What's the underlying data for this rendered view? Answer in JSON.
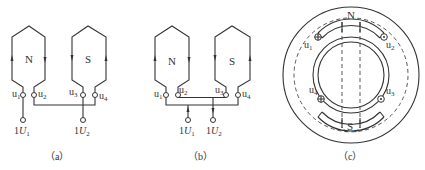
{
  "figure": {
    "panels": [
      {
        "caption": "(a)",
        "coils": [
          {
            "pole": "N",
            "terminals": [
              "u1",
              "u2"
            ]
          },
          {
            "pole": "S",
            "terminals": [
              "u3",
              "u4"
            ]
          }
        ],
        "supply": [
          "1U1",
          "1U2"
        ]
      },
      {
        "caption": "(b)",
        "coils": [
          {
            "pole": "N",
            "terminals": [
              "u1",
              "u2"
            ]
          },
          {
            "pole": "S",
            "terminals": [
              "u3",
              "u4"
            ]
          }
        ],
        "supply": [
          "1U1",
          "1U2"
        ]
      },
      {
        "caption": "(c)",
        "poles": [
          "N",
          "S"
        ],
        "terminals": [
          "u1",
          "u2",
          "u3",
          "u4"
        ]
      }
    ]
  },
  "labels": {
    "a": {
      "N": "N",
      "S": "S",
      "u1": "u",
      "u1s": "1",
      "u2": "u",
      "u2s": "2",
      "u3": "u",
      "u3s": "3",
      "u4": "u",
      "u4s": "4",
      "U1p": "1",
      "U1": "U",
      "U1s": "1",
      "U2p": "1",
      "U2": "U",
      "U2s": "2",
      "cap": "（a）"
    },
    "b": {
      "N": "N",
      "S": "S",
      "u1": "u",
      "u1s": "1",
      "u2": "u",
      "u2s": "2",
      "u3": "u",
      "u3s": "3",
      "u4": "u",
      "u4s": "4",
      "U1p": "1",
      "U1": "U",
      "U1s": "1",
      "U2p": "1",
      "U2": "U",
      "U2s": "2",
      "cap": "（b）"
    },
    "c": {
      "N": "N",
      "S": "S",
      "u1": "u",
      "u1s": "1",
      "u2": "u",
      "u2s": "2",
      "u3": "u",
      "u3s": "3",
      "u4": "u",
      "u4s": "4",
      "cap": "（c）"
    }
  }
}
